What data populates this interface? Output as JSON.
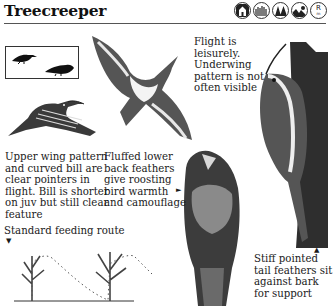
{
  "header": {
    "title": "Treecreeper",
    "habitat_icons": [
      {
        "name": "town-garden-icon",
        "label": ""
      },
      {
        "name": "farmland-icon",
        "label": ""
      },
      {
        "name": "woodland-icon",
        "label": ""
      },
      {
        "name": "heath-moor-icon",
        "label": ""
      },
      {
        "name": "resident-icon",
        "label": "R",
        "sub": "m"
      }
    ]
  },
  "captions": {
    "upper_wing": "Upper wing pattern and curved bill are clear pointers in flight. Bill is shorter on juv but still clear feature",
    "fluffed": "Fluffed lower back feathers give roosting bird warmth and camouflage",
    "flight": "Flight is leisurely. Underwing pattern is not often visible",
    "feeding_route": "Standard feeding route",
    "tail": "Stiff pointed tail feathers sit against bark for support"
  },
  "markers": {
    "down_arrow": "▼",
    "right_arrow": "►",
    "up_arrow": "▲"
  },
  "colors": {
    "ink": "#1a1a1a",
    "background": "#ffffff",
    "rule": "#555555"
  }
}
